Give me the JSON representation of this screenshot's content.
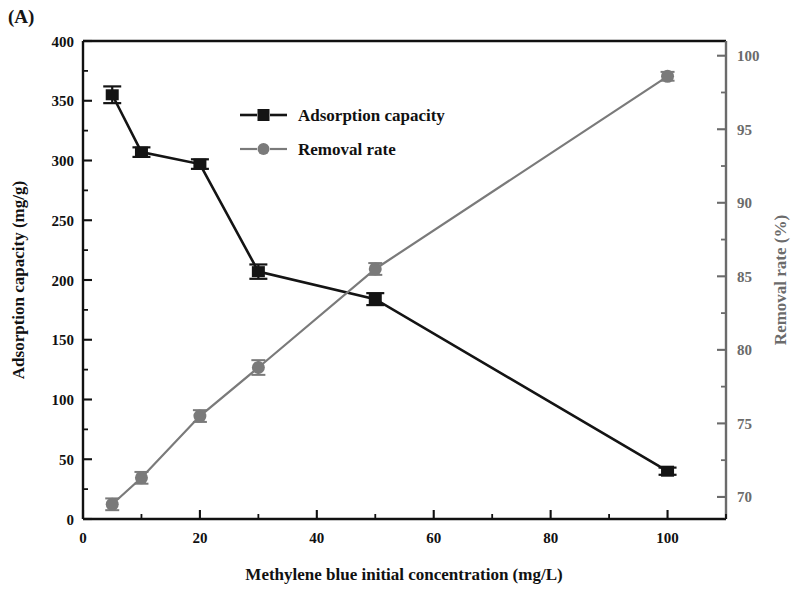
{
  "panel": {
    "label": "(A)"
  },
  "chart_data": {
    "type": "line",
    "title": "",
    "subtitle": "",
    "xlabel": "Methylene blue initial concentration (mg/L)",
    "ylabel": "Adsorption capacity (mg/g)",
    "y2label": "Removal rate (%)",
    "x": [
      5,
      10,
      20,
      30,
      50,
      100
    ],
    "xlim": [
      0,
      110
    ],
    "xticks": [
      0,
      20,
      40,
      60,
      80,
      100
    ],
    "xticklabels": [
      "0",
      "20",
      "40",
      "60",
      "80",
      "100"
    ],
    "xminorticks": [
      10,
      30,
      50,
      70,
      90,
      110
    ],
    "ylim": [
      0,
      400
    ],
    "yticks": [
      0,
      50,
      100,
      150,
      200,
      250,
      300,
      350,
      400
    ],
    "yticklabels": [
      "0",
      "50",
      "100",
      "150",
      "200",
      "250",
      "300",
      "350",
      "400"
    ],
    "yminorticks": [
      25,
      75,
      125,
      175,
      225,
      275,
      325,
      375
    ],
    "y2lim": [
      68.5,
      101
    ],
    "y2ticks": [
      70,
      75,
      80,
      85,
      90,
      95,
      100
    ],
    "y2ticklabels": [
      "70",
      "75",
      "80",
      "85",
      "90",
      "95",
      "100"
    ],
    "y2minorticks": [
      72.5,
      77.5,
      82.5,
      87.5,
      92.5,
      97.5
    ],
    "grid": false,
    "legend_position": "upper-center",
    "series": [
      {
        "name": "Adsorption capacity",
        "axis": "left",
        "marker": "square",
        "color": "#141414",
        "values": [
          355,
          307,
          297,
          207,
          184,
          40
        ],
        "errors": [
          7,
          4,
          4,
          6,
          5,
          3
        ]
      },
      {
        "name": "Removal rate",
        "axis": "right",
        "marker": "circle",
        "color": "#7a7a7a",
        "values": [
          69.5,
          71.3,
          75.5,
          78.8,
          85.5,
          98.6
        ],
        "errors": [
          0.4,
          0.4,
          0.4,
          0.5,
          0.4,
          0.3
        ]
      }
    ],
    "legend": [
      {
        "label": "Adsorption capacity",
        "marker": "square",
        "color": "#141414"
      },
      {
        "label": "Removal rate",
        "marker": "circle",
        "color": "#7a7a7a"
      }
    ]
  }
}
